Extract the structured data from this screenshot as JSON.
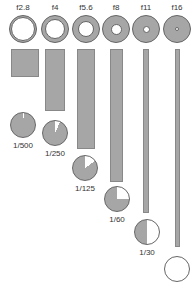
{
  "columns": [
    {
      "aperture": "f2.8",
      "shutter": "1/500",
      "cx": 23,
      "hole": 24,
      "bar": {
        "x": 11,
        "w": 28,
        "h": 28
      },
      "pie": {
        "x": 10,
        "y": 112,
        "white_deg": 4
      },
      "sy": 141
    },
    {
      "aperture": "f4",
      "shutter": "1/250",
      "cx": 55,
      "hole": 20,
      "bar": {
        "x": 45,
        "w": 20,
        "h": 62
      },
      "pie": {
        "x": 42,
        "y": 120,
        "white_deg": 25
      },
      "sy": 149
    },
    {
      "aperture": "f5.6",
      "shutter": "1/125",
      "cx": 86,
      "hole": 16,
      "bar": {
        "x": 77,
        "w": 18,
        "h": 100
      },
      "pie": {
        "x": 72,
        "y": 155,
        "white_deg": 55
      },
      "sy": 184
    },
    {
      "aperture": "f8",
      "shutter": "1/60",
      "cx": 116,
      "hole": 11,
      "bar": {
        "x": 110,
        "w": 13,
        "h": 133
      },
      "pie": {
        "x": 104,
        "y": 186,
        "white_deg": 90
      },
      "sy": 215
    },
    {
      "aperture": "f11",
      "shutter": "1/30",
      "cx": 146,
      "hole": 7,
      "bar": {
        "x": 143,
        "w": 6,
        "h": 164
      },
      "pie": {
        "x": 134,
        "y": 219,
        "white_deg": 180
      },
      "sy": 248
    },
    {
      "aperture": "f16",
      "shutter": "1/15",
      "cx": 177,
      "hole": 4,
      "bar": {
        "x": 175,
        "w": 5,
        "h": 198
      },
      "pie": {
        "x": 164,
        "y": 256,
        "white_deg": 360
      },
      "sy": 285
    }
  ]
}
